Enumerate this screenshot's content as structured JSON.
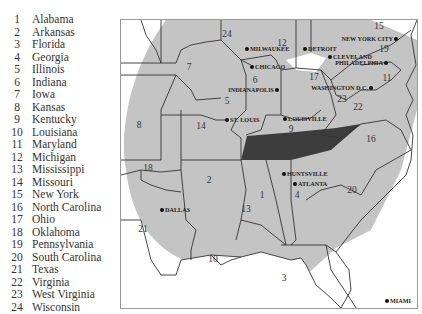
{
  "legend": [
    {
      "num": "1",
      "name": "Alabama"
    },
    {
      "num": "2",
      "name": "Arkansas"
    },
    {
      "num": "3",
      "name": "Florida"
    },
    {
      "num": "4",
      "name": "Georgia"
    },
    {
      "num": "5",
      "name": "Illinois"
    },
    {
      "num": "6",
      "name": "Indiana"
    },
    {
      "num": "7",
      "name": "Iowa"
    },
    {
      "num": "8",
      "name": "Kansas"
    },
    {
      "num": "9",
      "name": "Kentucky"
    },
    {
      "num": "10",
      "name": "Louisiana"
    },
    {
      "num": "11",
      "name": "Maryland"
    },
    {
      "num": "12",
      "name": "Michigan"
    },
    {
      "num": "13",
      "name": "Mississippi"
    },
    {
      "num": "14",
      "name": "Missouri"
    },
    {
      "num": "15",
      "name": "New York"
    },
    {
      "num": "16",
      "name": "North Carolina"
    },
    {
      "num": "17",
      "name": "Ohio"
    },
    {
      "num": "18",
      "name": "Oklahoma"
    },
    {
      "num": "19",
      "name": "Pennsylvania"
    },
    {
      "num": "20",
      "name": "South Carolina"
    },
    {
      "num": "21",
      "name": "Texas"
    },
    {
      "num": "22",
      "name": "Virginia"
    },
    {
      "num": "23",
      "name": "West Virginia"
    },
    {
      "num": "24",
      "name": "Wisconsin"
    }
  ],
  "map": {
    "colors": {
      "region": "#c4c4c4",
      "highlight": "#3c3c3c",
      "border": "#333333",
      "background": "#ffffff"
    },
    "state_labels": [
      {
        "num": "1",
        "x": 141,
        "y": 178
      },
      {
        "num": "2",
        "x": 88,
        "y": 163
      },
      {
        "num": "3",
        "x": 163,
        "y": 261
      },
      {
        "num": "4",
        "x": 176,
        "y": 178
      },
      {
        "num": "5",
        "x": 106,
        "y": 84
      },
      {
        "num": "6",
        "x": 134,
        "y": 63
      },
      {
        "num": "7",
        "x": 68,
        "y": 50
      },
      {
        "num": "8",
        "x": 18,
        "y": 108
      },
      {
        "num": "9",
        "x": 170,
        "y": 112
      },
      {
        "num": "10",
        "x": 92,
        "y": 242
      },
      {
        "num": "11",
        "x": 266,
        "y": 61
      },
      {
        "num": "12",
        "x": 161,
        "y": 26
      },
      {
        "num": "13",
        "x": 125,
        "y": 192
      },
      {
        "num": "14",
        "x": 80,
        "y": 109
      },
      {
        "num": "15",
        "x": 258,
        "y": 9
      },
      {
        "num": "16",
        "x": 250,
        "y": 122
      },
      {
        "num": "17",
        "x": 193,
        "y": 60
      },
      {
        "num": "18",
        "x": 27,
        "y": 151
      },
      {
        "num": "19",
        "x": 263,
        "y": 32
      },
      {
        "num": "20",
        "x": 231,
        "y": 173
      },
      {
        "num": "21",
        "x": 22,
        "y": 212
      },
      {
        "num": "22",
        "x": 237,
        "y": 90
      },
      {
        "num": "23",
        "x": 221,
        "y": 82
      },
      {
        "num": "24",
        "x": 106,
        "y": 17
      }
    ],
    "cities": [
      {
        "name": "MILWAUKEE",
        "x": 126,
        "y": 29,
        "anchor": "start"
      },
      {
        "name": "DETROIT",
        "x": 184,
        "y": 29,
        "anchor": "start"
      },
      {
        "name": "NEW YORK CITY",
        "x": 275,
        "y": 19,
        "anchor": "end"
      },
      {
        "name": "CHICAGO",
        "x": 131,
        "y": 47,
        "anchor": "start"
      },
      {
        "name": "CLEVELAND",
        "x": 209,
        "y": 37,
        "anchor": "start"
      },
      {
        "name": "PHILADELPHIA",
        "x": 265,
        "y": 43,
        "anchor": "end"
      },
      {
        "name": "INDIANAPOLIS",
        "x": 156,
        "y": 70,
        "anchor": "end"
      },
      {
        "name": "WASHINGTON D.C.",
        "x": 250,
        "y": 68,
        "anchor": "end"
      },
      {
        "name": "ST. LOUIS",
        "x": 106,
        "y": 100,
        "anchor": "start"
      },
      {
        "name": "LOUISVILLE",
        "x": 164,
        "y": 99,
        "anchor": "start"
      },
      {
        "name": "HUNTSVILLE",
        "x": 163,
        "y": 154,
        "anchor": "start"
      },
      {
        "name": "ATLANTA",
        "x": 174,
        "y": 164,
        "anchor": "start"
      },
      {
        "name": "DALLAS",
        "x": 41,
        "y": 190,
        "anchor": "start"
      },
      {
        "name": "MIAMI",
        "x": 266,
        "y": 281,
        "anchor": "start"
      }
    ]
  }
}
